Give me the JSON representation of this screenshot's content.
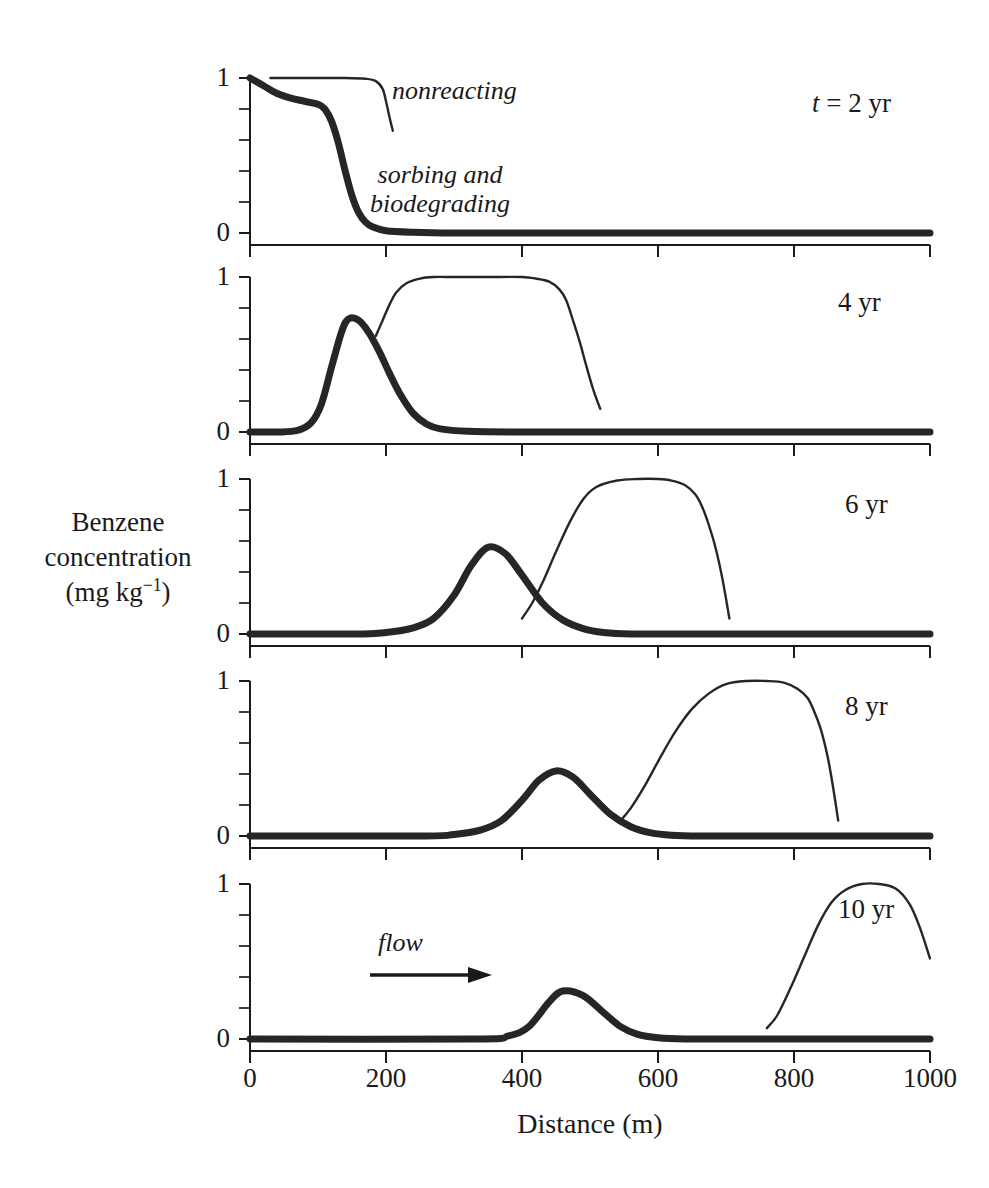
{
  "figure": {
    "y_axis_title_lines": [
      "Benzene",
      "concentration",
      "(mg kg"
    ],
    "y_axis_title_exponent": "−1",
    "y_axis_title_close": ")",
    "x_axis_title": "Distance (m)",
    "annotations": {
      "nonreacting": "nonreacting",
      "sorbing_line1": "sorbing and",
      "sorbing_line2": "biodegrading",
      "flow": "flow"
    }
  },
  "chart_data": {
    "type": "line",
    "title": "",
    "xlabel": "Distance (m)",
    "ylabel": "Benzene concentration (mg kg-1)",
    "xlim": [
      0,
      1000
    ],
    "ylim": [
      0,
      1
    ],
    "xticks": [
      0,
      200,
      400,
      600,
      800,
      1000
    ],
    "xtick_labels": [
      "0",
      "200",
      "400",
      "600",
      "800",
      "1000"
    ],
    "yticks": [
      0,
      1
    ],
    "ytick_labels": [
      "0",
      "1"
    ],
    "y_minor_ticks": [
      0.2,
      0.4,
      0.6,
      0.8
    ],
    "grid": false,
    "legend": "inline-annotation",
    "annotations": [
      {
        "text": "nonreacting",
        "panel": 0,
        "x": 210,
        "y": 0.93
      },
      {
        "text": "sorbing and biodegrading",
        "panel": 0,
        "x": 250,
        "y": 0.55
      },
      {
        "text": "flow",
        "panel": 4,
        "x": 300,
        "y": 0.55,
        "arrow": "right"
      }
    ],
    "panels": [
      {
        "label_prefix": "t = ",
        "label": "2 yr",
        "time_years": 2,
        "series": [
          {
            "name": "sorbing and biodegrading",
            "style": "thick",
            "x": [
              0,
              20,
              40,
              60,
              80,
              100,
              110,
              120,
              130,
              140,
              150,
              160,
              170,
              180,
              200,
              240,
              300,
              400,
              600,
              800,
              1000
            ],
            "y": [
              1.0,
              0.95,
              0.9,
              0.87,
              0.85,
              0.83,
              0.8,
              0.72,
              0.58,
              0.4,
              0.24,
              0.13,
              0.07,
              0.04,
              0.015,
              0.005,
              0.0,
              0.0,
              0.0,
              0.0,
              0.0
            ]
          },
          {
            "name": "nonreacting",
            "style": "thin",
            "x": [
              30,
              60,
              100,
              140,
              170,
              185,
              195,
              200,
              205,
              210
            ],
            "y": [
              1.0,
              1.0,
              1.0,
              1.0,
              0.995,
              0.98,
              0.93,
              0.85,
              0.75,
              0.66
            ]
          }
        ]
      },
      {
        "label_prefix": "",
        "label": "4 yr",
        "time_years": 4,
        "series": [
          {
            "name": "sorbing and biodegrading",
            "style": "thick",
            "x": [
              0,
              40,
              70,
              90,
              105,
              120,
              135,
              145,
              160,
              175,
              190,
              205,
              220,
              240,
              260,
              280,
              320,
              400,
              600,
              800,
              1000
            ],
            "y": [
              0.0,
              0.0,
              0.01,
              0.06,
              0.18,
              0.42,
              0.65,
              0.73,
              0.72,
              0.64,
              0.52,
              0.38,
              0.25,
              0.12,
              0.05,
              0.02,
              0.005,
              0.0,
              0.0,
              0.0,
              0.0
            ]
          },
          {
            "name": "nonreacting",
            "style": "thin",
            "x": [
              185,
              195,
              205,
              215,
              230,
              250,
              270,
              300,
              350,
              400,
              420,
              440,
              455,
              465,
              475,
              485,
              495,
              505,
              515
            ],
            "y": [
              0.62,
              0.72,
              0.82,
              0.9,
              0.96,
              0.99,
              1.0,
              1.0,
              1.0,
              1.0,
              0.99,
              0.97,
              0.92,
              0.85,
              0.72,
              0.58,
              0.42,
              0.27,
              0.15
            ]
          }
        ]
      },
      {
        "label_prefix": "",
        "label": "6 yr",
        "time_years": 6,
        "series": [
          {
            "name": "sorbing and biodegrading",
            "style": "thick",
            "x": [
              0,
              150,
              200,
              240,
              270,
              300,
              325,
              350,
              375,
              400,
              430,
              460,
              490,
              520,
              560,
              640,
              800,
              1000
            ],
            "y": [
              0.0,
              0.0,
              0.01,
              0.04,
              0.1,
              0.25,
              0.44,
              0.56,
              0.52,
              0.38,
              0.2,
              0.09,
              0.035,
              0.01,
              0.0,
              0.0,
              0.0,
              0.0
            ]
          },
          {
            "name": "nonreacting",
            "style": "thin",
            "x": [
              400,
              415,
              430,
              450,
              470,
              490,
              510,
              540,
              570,
              600,
              620,
              640,
              655,
              665,
              675,
              685,
              695,
              705
            ],
            "y": [
              0.1,
              0.2,
              0.33,
              0.53,
              0.72,
              0.87,
              0.95,
              0.99,
              1.0,
              1.0,
              0.99,
              0.96,
              0.9,
              0.82,
              0.7,
              0.55,
              0.35,
              0.1
            ]
          }
        ]
      },
      {
        "label_prefix": "",
        "label": "8 yr",
        "time_years": 8,
        "series": [
          {
            "name": "sorbing and biodegrading",
            "style": "thick",
            "x": [
              0,
              250,
              300,
              340,
              370,
              400,
              425,
              450,
              475,
              500,
              530,
              560,
              590,
              620,
              660,
              760,
              900,
              1000
            ],
            "y": [
              0.0,
              0.0,
              0.01,
              0.04,
              0.1,
              0.23,
              0.36,
              0.42,
              0.38,
              0.27,
              0.14,
              0.06,
              0.02,
              0.005,
              0.0,
              0.0,
              0.0,
              0.0
            ]
          },
          {
            "name": "nonreacting",
            "style": "thin",
            "x": [
              545,
              560,
              580,
              600,
              625,
              650,
              675,
              700,
              730,
              760,
              785,
              805,
              820,
              830,
              840,
              850,
              858,
              865
            ],
            "y": [
              0.1,
              0.18,
              0.32,
              0.48,
              0.67,
              0.82,
              0.92,
              0.98,
              1.0,
              1.0,
              0.99,
              0.95,
              0.89,
              0.8,
              0.68,
              0.5,
              0.3,
              0.1
            ]
          }
        ]
      },
      {
        "label_prefix": "",
        "label": "10 yr",
        "time_years": 10,
        "series": [
          {
            "name": "sorbing and biodegrading",
            "style": "thick",
            "x": [
              0,
              330,
              380,
              410,
              440,
              460,
              490,
              520,
              545,
              570,
              600,
              640,
              720,
              860,
              1000
            ],
            "y": [
              0.0,
              0.0,
              0.02,
              0.08,
              0.24,
              0.31,
              0.28,
              0.17,
              0.08,
              0.03,
              0.008,
              0.0,
              0.0,
              0.0,
              0.0
            ]
          },
          {
            "name": "nonreacting",
            "style": "thin",
            "x": [
              760,
              775,
              795,
              815,
              835,
              855,
              875,
              900,
              925,
              950,
              970,
              985,
              1000
            ],
            "y": [
              0.07,
              0.15,
              0.33,
              0.53,
              0.73,
              0.88,
              0.96,
              1.0,
              1.0,
              0.97,
              0.87,
              0.72,
              0.52
            ]
          }
        ]
      }
    ]
  },
  "panel_time_labels": [
    {
      "prefix": "t = ",
      "value": "2 yr"
    },
    {
      "prefix": "",
      "value": "4 yr"
    },
    {
      "prefix": "",
      "value": "6 yr"
    },
    {
      "prefix": "",
      "value": "8 yr"
    },
    {
      "prefix": "",
      "value": "10 yr"
    }
  ],
  "axis": {
    "ytick_top": "1",
    "ytick_bottom": "0",
    "xticks": [
      "0",
      "200",
      "400",
      "600",
      "800",
      "1000"
    ]
  }
}
